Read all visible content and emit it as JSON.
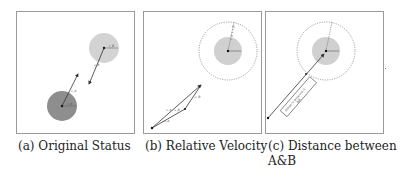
{
  "figure": {
    "panels": [
      {
        "id": "a",
        "caption": "(a) Original Status",
        "agent_a": {
          "label": "A",
          "velocity_label": "v_A",
          "color": "#8c8c8c"
        },
        "agent_b": {
          "label": "B",
          "velocity_label": "v_B",
          "color": "#d0d0d0"
        },
        "radius_labels": [
          "r_A",
          "r_B"
        ]
      },
      {
        "id": "b",
        "caption": "(b) Relative Velocity",
        "expanded_radius_label": "r_A + r_B",
        "vector_labels": [
          "v_A",
          "-v_B",
          "v_A - v_B"
        ],
        "obstacle_color": "#d0d0d0"
      },
      {
        "id": "c",
        "caption_line1": "(c) Distance between",
        "caption_line2": "A&B",
        "box_label": "distance between A",
        "box_sublabel": "&B",
        "expanded_radius_label": "r_A + r_B"
      }
    ]
  }
}
